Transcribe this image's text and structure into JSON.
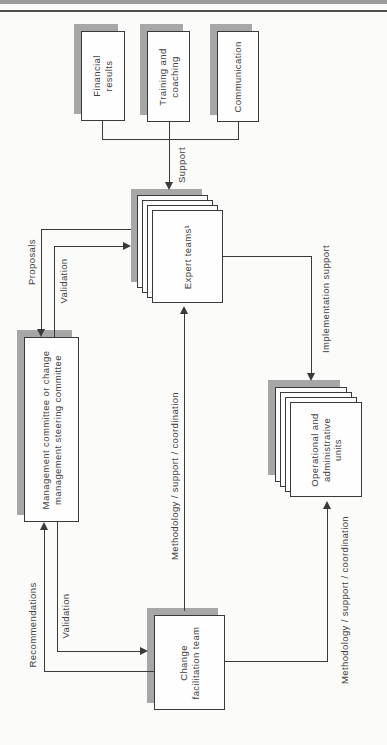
{
  "figure": {
    "type": "change-management organization flow diagram (rotated sideways on page)"
  },
  "colors": {
    "line": "#3a3a3a",
    "shadow": "#a7a7a7",
    "box_fill": "#fefefe",
    "text": "#404040",
    "page_bg": "#fbfbf9",
    "rule_thick": "#9b9b9b",
    "rule_thin": "#4f4f4f"
  },
  "nodes": {
    "financial_results": {
      "label": "Financial\nresults"
    },
    "training_coaching": {
      "label": "Training and\ncoaching"
    },
    "communication": {
      "label": "Communication"
    },
    "expert_teams": {
      "label": "Expert teams¹",
      "stacked": true
    },
    "management_committee": {
      "label": "Management committee or change\nmanagement steering committee"
    },
    "operational_units": {
      "label": "Operational and\nadministrative\nunits",
      "stacked": true
    },
    "change_facilitation_team": {
      "label": "Change\nfacilitation team"
    }
  },
  "edges": {
    "support": {
      "label": "Support",
      "from": "financial_results / training_coaching / communication",
      "to": "expert_teams"
    },
    "proposals": {
      "label": "Proposals",
      "from": "expert_teams",
      "to": "management_committee"
    },
    "validation_upper": {
      "label": "Validation",
      "from": "management_committee",
      "to": "expert_teams"
    },
    "recommendations": {
      "label": "Recommendations",
      "from": "change_facilitation_team",
      "to": "management_committee"
    },
    "validation_lower": {
      "label": "Validation",
      "from": "management_committee",
      "to": "change_facilitation_team"
    },
    "methodology_center": {
      "label": "Methodology / support / coordination",
      "from": "change_facilitation_team",
      "to": "expert_teams"
    },
    "implementation_support": {
      "label": "Implementation support",
      "from": "expert_teams",
      "to": "operational_units"
    },
    "methodology_right": {
      "label": "Methodology / support / coordination",
      "from": "change_facilitation_team",
      "to": "operational_units"
    }
  }
}
